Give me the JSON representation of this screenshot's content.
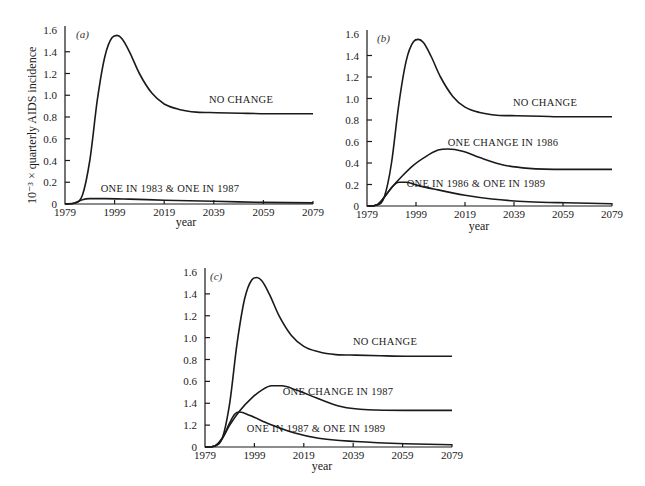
{
  "figure": {
    "ylabel": "10⁻³ × quarterly AIDS incidence",
    "xlabel": "year"
  },
  "chart_data": [
    {
      "type": "line",
      "panel": "(a)",
      "xlabel": "year",
      "ylabel": "10^-3 × quarterly AIDS incidence",
      "xlim": [
        1979,
        2079
      ],
      "ylim": [
        0,
        1.6
      ],
      "xticks": [
        "1979",
        "1999",
        "2019",
        "2039",
        "2059",
        "2079"
      ],
      "yticks": [
        "0",
        "0.2",
        "0.4",
        "0.6",
        "0.8",
        "1.0",
        "1.2",
        "1.4",
        "1.6"
      ],
      "grid": false,
      "series": [
        {
          "name": "NO CHANGE",
          "x": [
            1979,
            1983,
            1986,
            1989,
            1992,
            1995,
            1998,
            2000,
            2002,
            2005,
            2009,
            2014,
            2019,
            2025,
            2032,
            2040,
            2050,
            2060,
            2079
          ],
          "y": [
            0,
            0.01,
            0.08,
            0.4,
            0.95,
            1.35,
            1.53,
            1.55,
            1.52,
            1.4,
            1.2,
            1.02,
            0.92,
            0.87,
            0.845,
            0.84,
            0.835,
            0.83,
            0.83
          ]
        },
        {
          "name": "ONE IN 1983 & ONE IN 1987",
          "x": [
            1979,
            1983,
            1986,
            1989,
            1995,
            2005,
            2019,
            2039,
            2059,
            2079
          ],
          "y": [
            0,
            0.01,
            0.04,
            0.05,
            0.05,
            0.045,
            0.035,
            0.025,
            0.015,
            0.01
          ]
        }
      ]
    },
    {
      "type": "line",
      "panel": "(b)",
      "xlabel": "year",
      "xlim": [
        1979,
        2079
      ],
      "ylim": [
        0,
        1.6
      ],
      "xticks": [
        "1979",
        "1999",
        "2019",
        "2039",
        "2059",
        "2079"
      ],
      "yticks": [
        "0",
        "0.2",
        "0.4",
        "0.6",
        "0.8",
        "1.0",
        "1.2",
        "1.4",
        "1.6"
      ],
      "grid": false,
      "series": [
        {
          "name": "NO CHANGE",
          "x": [
            1979,
            1983,
            1986,
            1989,
            1992,
            1995,
            1998,
            2000,
            2002,
            2005,
            2009,
            2014,
            2019,
            2025,
            2032,
            2040,
            2050,
            2060,
            2079
          ],
          "y": [
            0,
            0.01,
            0.08,
            0.4,
            0.95,
            1.35,
            1.53,
            1.55,
            1.52,
            1.4,
            1.2,
            1.02,
            0.92,
            0.87,
            0.845,
            0.84,
            0.835,
            0.83,
            0.83
          ]
        },
        {
          "name": "ONE CHANGE IN 1986",
          "x": [
            1979,
            1983,
            1986,
            1989,
            1993,
            1998,
            2003,
            2008,
            2012,
            2018,
            2025,
            2035,
            2045,
            2060,
            2079
          ],
          "y": [
            0,
            0.01,
            0.08,
            0.17,
            0.27,
            0.38,
            0.46,
            0.52,
            0.53,
            0.51,
            0.45,
            0.38,
            0.35,
            0.34,
            0.34
          ]
        },
        {
          "name": "ONE IN 1986 & ONE IN 1989",
          "x": [
            1979,
            1983,
            1986,
            1989,
            1992,
            1995,
            2000,
            2008,
            2019,
            2030,
            2045,
            2060,
            2079
          ],
          "y": [
            0,
            0.01,
            0.08,
            0.17,
            0.22,
            0.22,
            0.19,
            0.15,
            0.1,
            0.065,
            0.04,
            0.03,
            0.02
          ]
        }
      ]
    },
    {
      "type": "line",
      "panel": "(c)",
      "xlabel": "year",
      "xlim": [
        1979,
        2079
      ],
      "ylim": [
        0,
        1.6
      ],
      "xticks": [
        "1979",
        "1999",
        "2019",
        "2039",
        "2059",
        "2079"
      ],
      "yticks": [
        "0",
        "1.2",
        "1.4",
        "0.6",
        "0.8",
        "1.0",
        "1.2",
        "1.4",
        "1.6"
      ],
      "grid": false,
      "series": [
        {
          "name": "NO CHANGE",
          "x": [
            1979,
            1983,
            1986,
            1989,
            1992,
            1995,
            1998,
            2000,
            2002,
            2005,
            2009,
            2014,
            2019,
            2025,
            2032,
            2040,
            2050,
            2060,
            2079
          ],
          "y": [
            0,
            0.01,
            0.08,
            0.4,
            0.95,
            1.35,
            1.53,
            1.55,
            1.52,
            1.4,
            1.2,
            1.02,
            0.92,
            0.87,
            0.845,
            0.84,
            0.835,
            0.83,
            0.83
          ]
        },
        {
          "name": "ONE CHANGE IN 1987",
          "x": [
            1979,
            1983,
            1986,
            1989,
            1993,
            1998,
            2002,
            2006,
            2010,
            2016,
            2024,
            2034,
            2045,
            2060,
            2079
          ],
          "y": [
            0,
            0.01,
            0.08,
            0.2,
            0.33,
            0.45,
            0.52,
            0.56,
            0.56,
            0.52,
            0.45,
            0.37,
            0.34,
            0.335,
            0.335
          ]
        },
        {
          "name": "ONE IN 1987 & ONE IN 1989",
          "x": [
            1979,
            1983,
            1986,
            1989,
            1991,
            1993,
            1997,
            2005,
            2015,
            2025,
            2040,
            2060,
            2079
          ],
          "y": [
            0,
            0.01,
            0.08,
            0.22,
            0.3,
            0.32,
            0.29,
            0.21,
            0.13,
            0.08,
            0.05,
            0.03,
            0.02
          ]
        }
      ]
    }
  ]
}
